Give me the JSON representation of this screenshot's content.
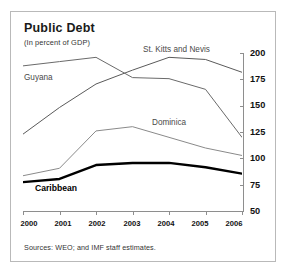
{
  "chart_data": {
    "type": "line",
    "title": "Public Debt",
    "subtitle": "(In percent of GDP)",
    "xlabel": "",
    "ylabel": "",
    "ylim": [
      50,
      200
    ],
    "yticks": [
      200,
      175,
      150,
      125,
      100,
      75,
      50
    ],
    "x": [
      "2000",
      "2001",
      "2002",
      "2003",
      "2004",
      "2005",
      "2006"
    ],
    "grid": false,
    "legend_position": "inline-annotations",
    "series": [
      {
        "name": "St. Kitts and Nevis",
        "color": "#5a5a5a",
        "width": 1,
        "values": [
          123,
          148,
          170,
          183,
          195,
          193,
          181
        ]
      },
      {
        "name": "Guyana",
        "color": "#6a6a6a",
        "width": 1,
        "values": [
          187,
          191,
          195,
          176,
          175,
          165,
          120
        ]
      },
      {
        "name": "Dominica",
        "color": "#8a8a8a",
        "width": 1,
        "values": [
          84,
          91,
          126,
          130,
          120,
          110,
          103
        ]
      },
      {
        "name": "Caribbean",
        "color": "#000000",
        "width": 2.4,
        "values": [
          78,
          81,
          94,
          96,
          96,
          92,
          86
        ]
      }
    ],
    "source_note": "Sources: WEO; and IMF staff estimates."
  },
  "labels": {
    "st_kitts": "St. Kitts and Nevis",
    "guyana": "Guyana",
    "dominica": "Dominica",
    "caribbean": "Caribbean"
  },
  "yticks": {
    "t0": "200",
    "t1": "175",
    "t2": "150",
    "t3": "125",
    "t4": "100",
    "t5": "75",
    "t6": "50"
  },
  "xticks": {
    "x0": "2000",
    "x1": "2001",
    "x2": "2002",
    "x3": "2003",
    "x4": "2004",
    "x5": "2005",
    "x6": "2006"
  }
}
